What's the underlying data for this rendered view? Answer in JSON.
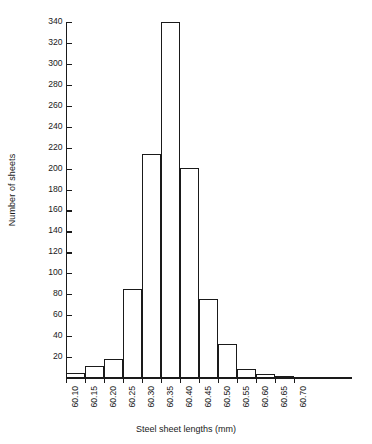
{
  "chart_data": {
    "type": "bar",
    "title": "",
    "xlabel": "Steel sheet lengths (mm)",
    "ylabel": "Number of sheets",
    "grid": false,
    "legend": false,
    "ylim": [
      0,
      340
    ],
    "y_ticks": [
      20,
      40,
      60,
      80,
      100,
      120,
      140,
      160,
      180,
      200,
      220,
      240,
      260,
      280,
      320,
      300,
      340
    ],
    "y_tick_labels_as_printed": [
      "20",
      "40",
      "60",
      "80",
      "100",
      "120",
      "140",
      "160",
      "180",
      "200",
      "220",
      "240",
      "260",
      "280",
      "320",
      "300",
      "340"
    ],
    "x_tick_labels": [
      "60.10",
      "60.15",
      "60.20",
      "60.25",
      "60.30",
      "60.35",
      "60.40",
      "60.45",
      "60.50",
      "60.55",
      "60.60",
      "60.65",
      "60.70"
    ],
    "bin_width": 0.05,
    "categories": [
      "60.10-60.15",
      "60.15-60.20",
      "60.20-60.25",
      "60.25-60.30",
      "60.30-60.35",
      "60.35-60.40",
      "60.40-60.45",
      "60.45-60.50",
      "60.50-60.55",
      "60.55-60.60",
      "60.60-60.65",
      "60.65-60.70"
    ],
    "values": [
      5,
      11,
      18,
      85,
      214,
      340,
      201,
      75,
      32,
      9,
      4,
      2
    ],
    "bar_style": "outline",
    "bar_color": "#1a1a1a"
  },
  "axes": {
    "y_title": "Number of sheets",
    "x_title": "Steel sheet lengths (mm)"
  }
}
